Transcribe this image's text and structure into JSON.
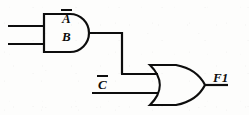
{
  "diagram": {
    "type": "logic-circuit-schematic",
    "expression": "F1 = (A' . B) + C'",
    "line_color": "#0d0d0d",
    "background_color": "#fdfdfc",
    "stroke_width": 2.2,
    "width": 249,
    "height": 115
  },
  "signals": {
    "input_a": {
      "label": "A",
      "complemented": true,
      "role": "input",
      "wire_y": 26
    },
    "input_b": {
      "label": "B",
      "complemented": false,
      "role": "input",
      "wire_y": 44
    },
    "input_c": {
      "label": "C",
      "complemented": true,
      "role": "input",
      "wire_y": 93
    },
    "output_f1": {
      "label": "F1",
      "complemented": false,
      "role": "output",
      "wire_y": 84
    }
  },
  "gates": {
    "and_gate": {
      "name": "AND",
      "symbol_style": "distinctive-shape-ansi",
      "inputs": [
        "A'",
        "B"
      ],
      "output": "A' . B",
      "x": 44,
      "y": 14,
      "width": 51,
      "height": 38
    },
    "or_gate": {
      "name": "OR",
      "symbol_style": "distinctive-shape-ansi",
      "inputs": [
        "A' . B",
        "C'"
      ],
      "output": "F1",
      "x": 150,
      "y": 65,
      "width": 55,
      "height": 40
    }
  },
  "nets": {
    "and_to_or": {
      "name": "and-output-net",
      "from": "and_gate.output",
      "to": "or_gate.input_top",
      "path": "(95,33) -> (122,33) -> (122,74) -> (157,74)"
    }
  }
}
